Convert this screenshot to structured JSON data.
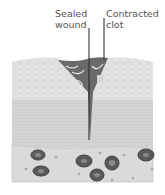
{
  "labels": {
    "sealed_wound": [
      "Sealed",
      "wound"
    ],
    "contracted_clot": [
      "Contracted",
      "clot"
    ]
  },
  "colors": {
    "epidermis": "#dcdcdc",
    "dermis": "#d2d2d2",
    "clot": "#6a6a6a",
    "vessel": "#d8d8d8",
    "rbc": "#5a5a5a",
    "line": "#222222"
  }
}
